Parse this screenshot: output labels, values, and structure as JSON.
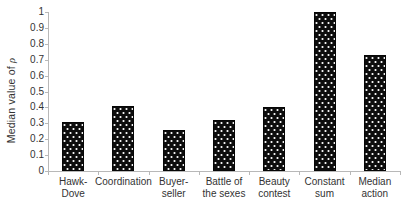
{
  "chart_data": {
    "type": "bar",
    "title": "",
    "xlabel": "",
    "ylabel": "Median value of ρ",
    "ylabel_parts": {
      "prefix": "Median value of ",
      "symbol": "ρ"
    },
    "categories": [
      "Hawk-\nDove",
      "Coordination",
      "Buyer-\nseller",
      "Battle of\nthe sexes",
      "Beauty\ncontest",
      "Constant\nsum",
      "Median\naction"
    ],
    "values": [
      0.31,
      0.41,
      0.26,
      0.32,
      0.4,
      1.0,
      0.73
    ],
    "ylim": [
      0,
      1
    ],
    "y_ticks": [
      0,
      0.1,
      0.2,
      0.3,
      0.4,
      0.5,
      0.6,
      0.7,
      0.8,
      0.9,
      1
    ],
    "y_tick_labels": [
      "0",
      "0.1",
      "0.2",
      "0.3",
      "0.4",
      "0.5",
      "0.6",
      "0.7",
      "0.8",
      "0.9",
      "1"
    ],
    "grid": false,
    "legend": false,
    "bar_style": "black fill with white speckle-dot pattern",
    "colors": {
      "bar": "#0d0d0d",
      "bar_dots": "#f2f2f2",
      "axis": "#b8b8b8",
      "text": "#333333",
      "background": "#ffffff"
    }
  }
}
